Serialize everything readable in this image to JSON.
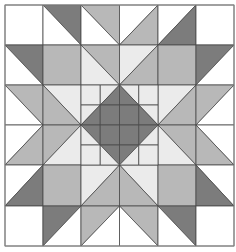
{
  "palette": {
    "W": "#ffffff",
    "L": "#ebebeb",
    "M": "#b8b8b8",
    "D": "#7c7c7c",
    "line": "#4a4a4a",
    "border": "#8a8a8a"
  },
  "grid": {
    "cols": 6,
    "rows": 6,
    "x": [
      5,
      43,
      81,
      119.5,
      158,
      196,
      234
    ],
    "y": [
      5,
      45,
      85,
      125,
      165,
      206,
      246
    ]
  },
  "cells": [
    [
      {
        "t": "solid",
        "c": "W"
      },
      {
        "t": "bs",
        "a": "D",
        "b": "W"
      },
      {
        "t": "bs",
        "a": "M",
        "b": "W"
      },
      {
        "t": "fs",
        "a": "W",
        "b": "M"
      },
      {
        "t": "fs",
        "a": "W",
        "b": "D"
      },
      {
        "t": "solid",
        "c": "W"
      }
    ],
    [
      {
        "t": "bs",
        "a": "D",
        "b": "W"
      },
      {
        "t": "solid",
        "c": "M"
      },
      {
        "t": "bs",
        "a": "M",
        "b": "L"
      },
      {
        "t": "fs",
        "a": "L",
        "b": "M"
      },
      {
        "t": "solid",
        "c": "M"
      },
      {
        "t": "fs",
        "a": "D",
        "b": "W"
      }
    ],
    [
      {
        "t": "bs",
        "a": "M",
        "b": "W"
      },
      {
        "t": "bs",
        "a": "L",
        "b": "M"
      },
      {
        "t": "center"
      },
      {
        "t": "center"
      },
      {
        "t": "fs",
        "a": "L",
        "b": "M"
      },
      {
        "t": "fs",
        "a": "M",
        "b": "W"
      }
    ],
    [
      {
        "t": "fs",
        "a": "W",
        "b": "M"
      },
      {
        "t": "fs",
        "a": "M",
        "b": "L"
      },
      {
        "t": "center"
      },
      {
        "t": "center"
      },
      {
        "t": "bs",
        "a": "M",
        "b": "L"
      },
      {
        "t": "bs",
        "a": "W",
        "b": "M"
      }
    ],
    [
      {
        "t": "fs",
        "a": "W",
        "b": "D"
      },
      {
        "t": "solid",
        "c": "M"
      },
      {
        "t": "fs",
        "a": "L",
        "b": "M"
      },
      {
        "t": "bs",
        "a": "L",
        "b": "M"
      },
      {
        "t": "solid",
        "c": "M"
      },
      {
        "t": "bs",
        "a": "W",
        "b": "D"
      }
    ],
    [
      {
        "t": "solid",
        "c": "W"
      },
      {
        "t": "fs",
        "a": "D",
        "b": "W"
      },
      {
        "t": "fs",
        "a": "M",
        "b": "W"
      },
      {
        "t": "bs",
        "a": "M",
        "b": "W"
      },
      {
        "t": "bs",
        "a": "D",
        "b": "W"
      },
      {
        "t": "solid",
        "c": "W"
      }
    ]
  ],
  "center_star": {
    "rows": 4,
    "cols": 4,
    "sub": [
      [
        {
          "t": "solid",
          "c": "L"
        },
        {
          "t": "fs",
          "a": "L",
          "b": "D"
        },
        {
          "t": "bs",
          "a": "L",
          "b": "D"
        },
        {
          "t": "solid",
          "c": "L"
        }
      ],
      [
        {
          "t": "fs",
          "a": "L",
          "b": "D"
        },
        {
          "t": "solid",
          "c": "D"
        },
        {
          "t": "solid",
          "c": "D"
        },
        {
          "t": "bs",
          "a": "L",
          "b": "D"
        }
      ],
      [
        {
          "t": "bs",
          "a": "D",
          "b": "L"
        },
        {
          "t": "solid",
          "c": "D"
        },
        {
          "t": "solid",
          "c": "D"
        },
        {
          "t": "fs",
          "a": "D",
          "b": "L"
        }
      ],
      [
        {
          "t": "solid",
          "c": "L"
        },
        {
          "t": "bs",
          "a": "D",
          "b": "L"
        },
        {
          "t": "fs",
          "a": "D",
          "b": "L"
        },
        {
          "t": "solid",
          "c": "L"
        }
      ]
    ]
  },
  "legend_notes": {
    "bs": "backslash diagonal: a = top-right triangle, b = bottom-left triangle",
    "fs": "forward-slash diagonal: a = top-left triangle, b = bottom-right triangle"
  }
}
